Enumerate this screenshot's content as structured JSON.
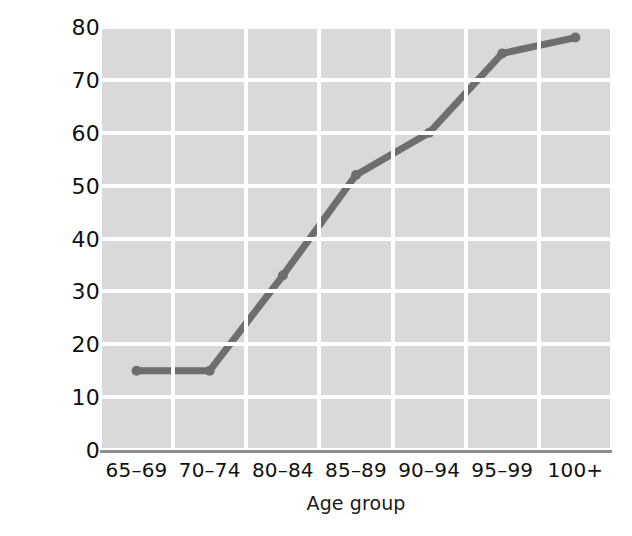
{
  "chart_data": {
    "type": "line",
    "title": "",
    "subtitle": "",
    "xlabel": "Age group",
    "ylabel": "Percent with a disability",
    "categories": [
      "65–69",
      "70–74",
      "80–84",
      "85–89",
      "90–94",
      "95–99",
      "100+"
    ],
    "values": [
      15,
      15,
      33,
      52,
      60,
      75,
      78
    ],
    "series": [
      {
        "name": "Percent with a disability",
        "values": [
          15,
          15,
          33,
          52,
          60,
          75,
          78
        ]
      }
    ],
    "ylim": [
      0,
      80
    ],
    "ytick_labels": [
      "0",
      "10",
      "20",
      "30",
      "40",
      "50",
      "60",
      "70",
      "80"
    ],
    "ytick_values": [
      0,
      10,
      20,
      30,
      40,
      50,
      60,
      70,
      80
    ],
    "grid": "both",
    "legend": "none",
    "annotations": [],
    "colors": {
      "line": "#6e6e6e",
      "marker": "#6e6e6e",
      "plot_background": "#d9d9d9",
      "gridline": "#ffffff",
      "axis_spine": "#8d8d8d",
      "text": "#111111",
      "figure_background": "#ffffff"
    },
    "line_width": 7,
    "marker_size": 10
  }
}
